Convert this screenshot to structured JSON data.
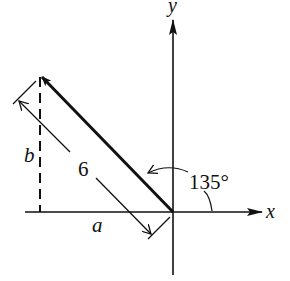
{
  "diagram": {
    "type": "vector-components",
    "axes": {
      "x_label": "x",
      "y_label": "y"
    },
    "vector": {
      "magnitude_label": "6",
      "angle_label": "135°",
      "horizontal_component_label": "a",
      "vertical_component_label": "b"
    },
    "colors": {
      "stroke": "#111111",
      "background": "#ffffff"
    }
  }
}
